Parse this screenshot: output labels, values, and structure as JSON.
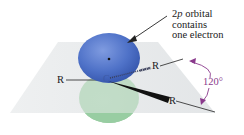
{
  "diagram": {
    "annotation": {
      "line1_prefix": "2",
      "line1_italic": "p",
      "line1_suffix": " orbital",
      "line2": "contains",
      "line3": "one electron"
    },
    "central_atom": "C",
    "substituents": [
      {
        "label": "R",
        "position": "left",
        "bond": "plain"
      },
      {
        "label": "R",
        "position": "back-right",
        "bond": "hashed"
      },
      {
        "label": "R",
        "position": "front-right",
        "bond": "wedge"
      }
    ],
    "bond_angle": "120°",
    "colors": {
      "upper_lobe": "#4a6fc4",
      "lower_lobe": "#9fcfa6",
      "plane": "#e6e8ea",
      "angle_arrow": "#8a3a8c",
      "text": "#1a1a1a"
    }
  }
}
